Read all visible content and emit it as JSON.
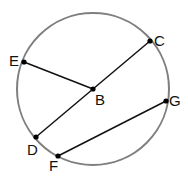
{
  "diagram": {
    "title": "",
    "circle": {
      "cx": 93,
      "cy": 89,
      "r": 76,
      "stroke": "#7f7f7f",
      "stroke_width": 2
    },
    "points": [
      {
        "id": "C",
        "label": "C",
        "x": 150,
        "y": 41,
        "label_x": 154,
        "label_y": 46
      },
      {
        "id": "E",
        "label": "E",
        "x": 24,
        "y": 62,
        "label_x": 9,
        "label_y": 66
      },
      {
        "id": "B",
        "label": "B",
        "x": 93,
        "y": 89,
        "label_x": 95,
        "label_y": 105
      },
      {
        "id": "D",
        "label": "D",
        "x": 36,
        "y": 137,
        "label_x": 27,
        "label_y": 155
      },
      {
        "id": "F",
        "label": "F",
        "x": 58,
        "y": 156,
        "label_x": 49,
        "label_y": 171
      },
      {
        "id": "G",
        "label": "G",
        "x": 166,
        "y": 101,
        "label_x": 169,
        "label_y": 106
      }
    ],
    "segments": [
      {
        "name": "segment-EB",
        "from": "E",
        "to": "B"
      },
      {
        "name": "segment-CD",
        "from": "C",
        "to": "D"
      },
      {
        "name": "segment-FG",
        "from": "F",
        "to": "G"
      }
    ],
    "colors": {
      "line": "#111111",
      "point": "#000000",
      "circle": "#7f7f7f"
    }
  }
}
